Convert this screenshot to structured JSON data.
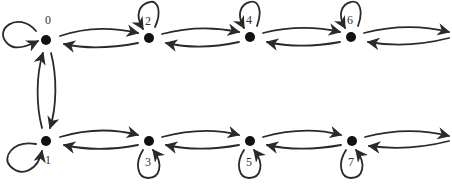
{
  "diagram": {
    "type": "state-transition-graph",
    "colors": {
      "stroke": "#2a2a2a",
      "node": "#111111",
      "label": "#333333",
      "background": "#ffffff"
    },
    "nodes": [
      {
        "id": "0",
        "label": "0",
        "x": 46,
        "y": 40
      },
      {
        "id": "2",
        "label": "2",
        "x": 149,
        "y": 38
      },
      {
        "id": "4",
        "label": "4",
        "x": 250,
        "y": 37
      },
      {
        "id": "6",
        "label": "6",
        "x": 351,
        "y": 37
      },
      {
        "id": "1",
        "label": "1",
        "x": 46,
        "y": 141
      },
      {
        "id": "3",
        "label": "3",
        "x": 149,
        "y": 141
      },
      {
        "id": "5",
        "label": "5",
        "x": 250,
        "y": 141
      },
      {
        "id": "7",
        "label": "7",
        "x": 352,
        "y": 141
      }
    ],
    "edges": [
      {
        "from": "0",
        "to": "0",
        "kind": "self-loop"
      },
      {
        "from": "2",
        "to": "2",
        "kind": "self-loop"
      },
      {
        "from": "4",
        "to": "4",
        "kind": "self-loop"
      },
      {
        "from": "6",
        "to": "6",
        "kind": "self-loop"
      },
      {
        "from": "1",
        "to": "1",
        "kind": "self-loop"
      },
      {
        "from": "3",
        "to": "3",
        "kind": "self-loop"
      },
      {
        "from": "5",
        "to": "5",
        "kind": "self-loop"
      },
      {
        "from": "7",
        "to": "7",
        "kind": "self-loop"
      },
      {
        "from": "0",
        "to": "2"
      },
      {
        "from": "2",
        "to": "0"
      },
      {
        "from": "2",
        "to": "4"
      },
      {
        "from": "4",
        "to": "2"
      },
      {
        "from": "4",
        "to": "6"
      },
      {
        "from": "6",
        "to": "4"
      },
      {
        "from": "6",
        "to": "right-out"
      },
      {
        "from": "right-out",
        "to": "6"
      },
      {
        "from": "1",
        "to": "3"
      },
      {
        "from": "3",
        "to": "1"
      },
      {
        "from": "3",
        "to": "5"
      },
      {
        "from": "5",
        "to": "3"
      },
      {
        "from": "5",
        "to": "7"
      },
      {
        "from": "7",
        "to": "5"
      },
      {
        "from": "7",
        "to": "right-out"
      },
      {
        "from": "right-out",
        "to": "7"
      },
      {
        "from": "0",
        "to": "1"
      },
      {
        "from": "1",
        "to": "0"
      }
    ]
  }
}
